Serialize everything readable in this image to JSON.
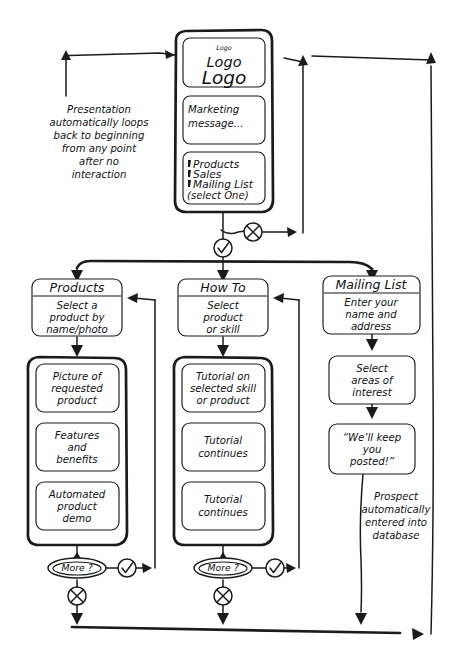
{
  "meta": {
    "style": "hand-drawn sketch",
    "ink_color": "#1b1b1b",
    "background_color": "#ffffff",
    "width": 455,
    "height": 671
  },
  "annotations": {
    "loop_back": "Presentation automatically loops back to beginning from any point after no interaction",
    "loop_back_lines": [
      "Presentation",
      "automatically loops",
      "back to beginning",
      "from any point",
      "after no",
      "interaction"
    ],
    "prospect": "Prospect automatically entered into database",
    "prospect_lines": [
      "Prospect",
      "automatically",
      "entered into",
      "database"
    ]
  },
  "attract_screen": {
    "name": "Attract loop / home screen",
    "logo_card": {
      "small": "Logo",
      "medium": "Logo",
      "large": "Logo"
    },
    "marketing_card": {
      "line1": "Marketing",
      "line2": "message..."
    },
    "menu_card": {
      "items": [
        "Products",
        "Sales",
        "Mailing List"
      ],
      "note": "(select One)"
    }
  },
  "decisions": {
    "home_timeout_symbol": "x-circle-icon",
    "home_select_symbol": "check-circle-icon",
    "more_label": "More ?",
    "more_yes_symbol": "check-circle-icon",
    "more_no_symbol": "x-circle-icon"
  },
  "columns": [
    {
      "id": "products",
      "header": {
        "title": "Products",
        "body_lines": [
          "Select a",
          "product by",
          "name/photo"
        ]
      },
      "screens": [
        {
          "lines": [
            "Picture of",
            "requested",
            "product"
          ]
        },
        {
          "lines": [
            "Features",
            "and",
            "benefits"
          ]
        },
        {
          "lines": [
            "Automated",
            "product",
            "demo"
          ]
        }
      ],
      "decision": "More ?"
    },
    {
      "id": "how-to",
      "header": {
        "title": "How To",
        "body_lines": [
          "Select",
          "product",
          "or skill"
        ]
      },
      "screens": [
        {
          "lines": [
            "Tutorial on",
            "selected skill",
            "or product"
          ]
        },
        {
          "lines": [
            "Tutorial",
            "continues"
          ]
        },
        {
          "lines": [
            "Tutorial",
            "continues"
          ]
        }
      ],
      "decision": "More ?"
    },
    {
      "id": "mailing-list",
      "header": {
        "title": "Mailing List",
        "body_lines": [
          "Enter your",
          "name and",
          "address"
        ]
      },
      "screens": [
        {
          "lines": [
            "Select",
            "areas of",
            "interest"
          ]
        },
        {
          "lines": [
            "“We’ll keep",
            "you",
            "posted!”"
          ]
        }
      ],
      "decision": null
    }
  ]
}
